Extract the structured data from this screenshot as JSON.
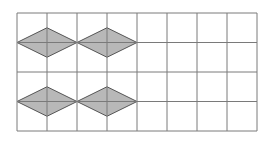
{
  "figure": {
    "grid": {
      "columns": 8,
      "rows": 4,
      "left": 17,
      "top": 13,
      "cell_width": 30,
      "cell_height": 29.5,
      "line_color": "#7a7a7a"
    },
    "rhombus_fill": "#b8b8b8",
    "rhombus_stroke": "#555555",
    "rhombi": [
      {
        "center_col_line": 1,
        "center_row_line": 1
      },
      {
        "center_col_line": 3,
        "center_row_line": 1
      },
      {
        "center_col_line": 1,
        "center_row_line": 3
      },
      {
        "center_col_line": 3,
        "center_row_line": 3
      }
    ]
  }
}
